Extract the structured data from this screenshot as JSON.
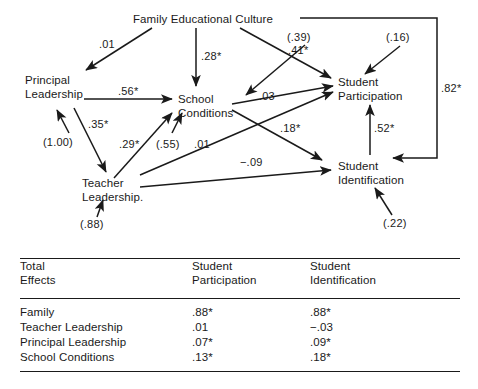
{
  "diagram": {
    "nodes": [
      {
        "id": "family",
        "lines": [
          "Family Educational Culture"
        ]
      },
      {
        "id": "principal",
        "lines": [
          "Principal",
          "Leadership"
        ]
      },
      {
        "id": "school",
        "lines": [
          "School",
          "Conditions"
        ]
      },
      {
        "id": "teacher",
        "lines": [
          "Teacher",
          "Leadership."
        ]
      },
      {
        "id": "participation",
        "lines": [
          "Student",
          "Participation"
        ]
      },
      {
        "id": "identification",
        "lines": [
          "Student",
          "Identification"
        ]
      }
    ],
    "node_text": {
      "family": "Family Educational Culture",
      "principal_l1": "Principal",
      "principal_l2": "Leadership",
      "school_l1": "School",
      "school_l2": "Conditions",
      "teacher_l1": "Teacher",
      "teacher_l2": "Leadership.",
      "participation_l1": "Student",
      "participation_l2": "Participation",
      "identification_l1": "Student",
      "identification_l2": "Identification"
    },
    "coefficients": {
      "family_to_principal": ".01",
      "family_to_school": ".28*",
      "family_to_participation": ".41*",
      "family_to_identification": ".82*",
      "principal_to_school": ".56*",
      "principal_to_teacher": ".35*",
      "teacher_to_school": ".29*",
      "teacher_to_participation": ".01",
      "teacher_to_identification": "−.09",
      "school_to_participation": ".03",
      "school_to_identification": ".18*",
      "identification_to_participation": ".52*"
    },
    "disturbances": {
      "principal": "(1.00)",
      "school": "(.55)",
      "teacher": "(.88)",
      "participation": "(.39)",
      "participation_alt": "(.16)",
      "identification": "(.22)"
    }
  },
  "table": {
    "header": {
      "row_label_line1": "Total",
      "row_label_line2": "Effects",
      "col1_line1": "Student",
      "col1_line2": "Participation",
      "col2_line1": "Student",
      "col2_line2": "Identification"
    },
    "rows": [
      {
        "label": "Family",
        "participation": ".88*",
        "identification": ".88*"
      },
      {
        "label": "Teacher Leadership",
        "participation": ".01",
        "identification": "−.03"
      },
      {
        "label": "Principal Leadership",
        "participation": ".07*",
        "identification": ".09*"
      },
      {
        "label": "School Conditions",
        "participation": ".13*",
        "identification": ".18*"
      }
    ]
  },
  "style": {
    "ink": "#1a1a1a",
    "paper": "#ffffff"
  }
}
